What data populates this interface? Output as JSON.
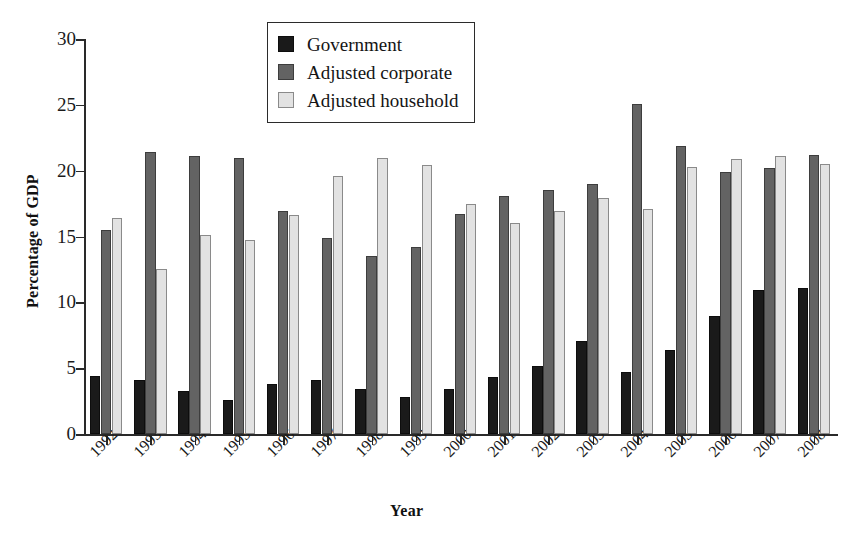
{
  "chart_data": {
    "type": "bar",
    "title": "",
    "xlabel": "Year",
    "ylabel": "Percentage of GDP",
    "ylim": [
      0,
      30
    ],
    "yticks": [
      0,
      5,
      10,
      15,
      20,
      25,
      30
    ],
    "grid": false,
    "legend_position": "top-center",
    "categories": [
      "1992",
      "1993",
      "1994",
      "1995",
      "1996",
      "1997",
      "1998",
      "1999",
      "2000",
      "2001",
      "2002",
      "2003",
      "2004",
      "2005",
      "2006",
      "2007",
      "2008"
    ],
    "series": [
      {
        "name": "Government",
        "color": "#1a1a1a",
        "values": [
          4.4,
          4.1,
          3.3,
          2.6,
          3.8,
          4.1,
          3.4,
          2.8,
          3.4,
          4.3,
          5.2,
          7.1,
          4.7,
          6.4,
          9.0,
          10.9,
          11.1
        ]
      },
      {
        "name": "Adjusted corporate",
        "color": "#636363",
        "values": [
          15.5,
          21.4,
          21.1,
          21.0,
          16.9,
          14.9,
          13.5,
          14.2,
          16.7,
          18.1,
          18.5,
          19.0,
          25.1,
          21.9,
          19.9,
          20.2,
          21.2
        ]
      },
      {
        "name": "Adjusted household",
        "color": "#e2e2e2",
        "values": [
          16.4,
          12.5,
          15.1,
          14.7,
          16.6,
          19.6,
          21.0,
          20.4,
          17.5,
          16.0,
          16.9,
          17.9,
          17.1,
          20.3,
          20.9,
          21.1,
          20.5
        ]
      }
    ]
  }
}
